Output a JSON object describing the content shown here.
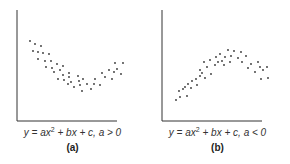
{
  "chart_data": [
    {
      "type": "scatter",
      "title": "",
      "caption": "y = ax² + bx + c, a > 0",
      "panel_label": "(a)",
      "xlabel": "",
      "ylabel": "",
      "grid": false,
      "axes_px": {
        "x0": 17,
        "y0": 121,
        "x1": 117,
        "ytop": 10
      },
      "points_px": [
        [
          30,
          41
        ],
        [
          35,
          44
        ],
        [
          41,
          46
        ],
        [
          33,
          51
        ],
        [
          38,
          52
        ],
        [
          43,
          53
        ],
        [
          49,
          54
        ],
        [
          38,
          59
        ],
        [
          45,
          61
        ],
        [
          51,
          61
        ],
        [
          57,
          64
        ],
        [
          63,
          66
        ],
        [
          46,
          67
        ],
        [
          52,
          68
        ],
        [
          60,
          70
        ],
        [
          69,
          73
        ],
        [
          54,
          72
        ],
        [
          63,
          75
        ],
        [
          69,
          77
        ],
        [
          78,
          76
        ],
        [
          58,
          79
        ],
        [
          64,
          80
        ],
        [
          71,
          82
        ],
        [
          79,
          81
        ],
        [
          83,
          79
        ],
        [
          68,
          84
        ],
        [
          74,
          87
        ],
        [
          80,
          85
        ],
        [
          87,
          84
        ],
        [
          95,
          79
        ],
        [
          82,
          91
        ],
        [
          91,
          89
        ],
        [
          94,
          84
        ],
        [
          100,
          85
        ],
        [
          102,
          73
        ],
        [
          105,
          77
        ],
        [
          109,
          70
        ],
        [
          112,
          79
        ],
        [
          115,
          63
        ],
        [
          117,
          69
        ],
        [
          114,
          72
        ],
        [
          121,
          74
        ],
        [
          123,
          63
        ]
      ],
      "shape": "upward-opening parabola (U shape)"
    },
    {
      "type": "scatter",
      "title": "",
      "caption": "y = ax² + bx + c, a < 0",
      "panel_label": "(b)",
      "xlabel": "",
      "ylabel": "",
      "grid": false,
      "axes_px": {
        "x0": 17,
        "y0": 121,
        "x1": 117,
        "ytop": 10
      },
      "points_px": [
        [
          31,
          100
        ],
        [
          35,
          97
        ],
        [
          34,
          91
        ],
        [
          38,
          89
        ],
        [
          40,
          87
        ],
        [
          42,
          96
        ],
        [
          43,
          84
        ],
        [
          47,
          81
        ],
        [
          46,
          88
        ],
        [
          51,
          79
        ],
        [
          52,
          85
        ],
        [
          55,
          76
        ],
        [
          55,
          70
        ],
        [
          57,
          73
        ],
        [
          59,
          62
        ],
        [
          60,
          78
        ],
        [
          62,
          67
        ],
        [
          65,
          60
        ],
        [
          66,
          74
        ],
        [
          70,
          65
        ],
        [
          71,
          57
        ],
        [
          73,
          62
        ],
        [
          75,
          54
        ],
        [
          77,
          61
        ],
        [
          79,
          65
        ],
        [
          80,
          57
        ],
        [
          83,
          50
        ],
        [
          85,
          62
        ],
        [
          86,
          56
        ],
        [
          89,
          51
        ],
        [
          93,
          58
        ],
        [
          96,
          52
        ],
        [
          97,
          62
        ],
        [
          101,
          56
        ],
        [
          103,
          68
        ],
        [
          106,
          64
        ],
        [
          110,
          72
        ],
        [
          113,
          62
        ],
        [
          115,
          67
        ],
        [
          116,
          79
        ],
        [
          118,
          70
        ],
        [
          122,
          67
        ],
        [
          123,
          78
        ]
      ],
      "shape": "downward-opening parabola (inverted U shape)"
    }
  ],
  "panels": [
    {
      "formula_lhs": "y = ax",
      "formula_exp": "2",
      "formula_rhs": " + bx + c, a > 0",
      "label": "(a)"
    },
    {
      "formula_lhs": "y = ax",
      "formula_exp": "2",
      "formula_rhs": " + bx + c, a < 0",
      "label": "(b)"
    }
  ],
  "colors": {
    "axis": "#333333",
    "dot": "#333333",
    "text": "#333333"
  }
}
